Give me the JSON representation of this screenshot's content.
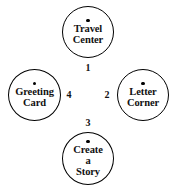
{
  "diagram": {
    "type": "node-link-cycle",
    "background_color": "#ffffff",
    "stroke_color": "#000000",
    "text_color": "#111111",
    "nodes": [
      {
        "id": "top",
        "label": "Travel\nCenter",
        "marker": "bullet-dot",
        "position": "top"
      },
      {
        "id": "right",
        "label": "Letter\nCorner",
        "marker": "bullet-dot",
        "position": "right"
      },
      {
        "id": "bottom",
        "label": "Create\na\nStory",
        "marker": "bullet-dot",
        "position": "bottom"
      },
      {
        "id": "left",
        "label": "Greeting\nCard",
        "marker": "bullet-dot",
        "position": "left"
      }
    ],
    "edge_labels": [
      {
        "id": "1",
        "text": "1",
        "near": "top"
      },
      {
        "id": "2",
        "text": "2",
        "near": "right"
      },
      {
        "id": "3",
        "text": "3",
        "near": "bottom"
      },
      {
        "id": "4",
        "text": "4",
        "near": "left"
      }
    ]
  }
}
